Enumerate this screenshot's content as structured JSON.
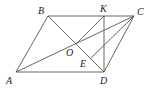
{
  "figure": {
    "type": "geometry",
    "colors": {
      "line": "#555555",
      "label": "#222222",
      "background": "#ffffff"
    },
    "points": {
      "A": {
        "label": "A",
        "x": 16,
        "y": 72,
        "lx": 6,
        "ly": 84
      },
      "B": {
        "label": "B",
        "x": 48,
        "y": 16,
        "lx": 38,
        "ly": 14
      },
      "C": {
        "label": "C",
        "x": 134,
        "y": 16,
        "lx": 137,
        "ly": 15
      },
      "D": {
        "label": "D",
        "x": 104,
        "y": 72,
        "lx": 100,
        "ly": 84
      },
      "K": {
        "label": "K",
        "x": 104,
        "y": 16,
        "lx": 100,
        "ly": 12
      },
      "O": {
        "label": "O",
        "x": 76,
        "y": 44,
        "lx": 66,
        "ly": 56
      },
      "E": {
        "label": "E",
        "x": 90,
        "y": 59,
        "lx": 80,
        "ly": 67
      }
    },
    "segments": [
      [
        "A",
        "B"
      ],
      [
        "B",
        "C"
      ],
      [
        "C",
        "D"
      ],
      [
        "D",
        "A"
      ],
      [
        "A",
        "C"
      ],
      [
        "B",
        "D"
      ],
      [
        "K",
        "D"
      ],
      [
        "K",
        "O"
      ],
      [
        "C",
        "E"
      ]
    ]
  }
}
